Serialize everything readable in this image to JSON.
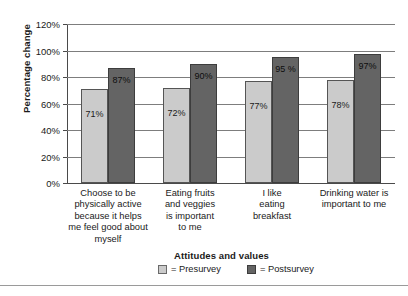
{
  "chart_data": {
    "type": "bar",
    "title": "",
    "xlabel": "Attitudes and values",
    "ylabel": "Percentage change",
    "ylim": [
      0,
      120
    ],
    "ytick_labels": [
      "0%",
      "20%",
      "40%",
      "60%",
      "80%",
      "100%",
      "120%"
    ],
    "ytick_values": [
      0,
      20,
      40,
      60,
      80,
      100,
      120
    ],
    "grid": true,
    "legend_position": "bottom",
    "categories": [
      "Choose to be\nphysically active\nbecause it helps\nme feel good about\nmyself",
      "Eating fruits\nand veggies\nis important\nto me",
      "I like\neating\nbreakfast",
      "Drinking water is\nimportant to me"
    ],
    "category_lines": [
      [
        "Choose to be",
        "physically active",
        "because it helps",
        "me feel good about",
        "myself"
      ],
      [
        "Eating fruits",
        "and veggies",
        "is important",
        "to me"
      ],
      [
        "I like",
        "eating",
        "breakfast"
      ],
      [
        "Drinking water is",
        "important to me"
      ]
    ],
    "series": [
      {
        "name": "Presurvey",
        "color": "#cbcbcb",
        "values": [
          71,
          72,
          77,
          78
        ],
        "labels": [
          "71%",
          "72%",
          "77%",
          "78%"
        ]
      },
      {
        "name": "Postsurvey",
        "color": "#646464",
        "values": [
          87,
          90,
          95,
          97
        ],
        "labels": [
          "87%",
          "90%",
          "95 %",
          "97%"
        ]
      }
    ]
  },
  "legend": {
    "items": [
      {
        "equals": "= Presurvey"
      },
      {
        "equals": "= Postsurvey"
      }
    ]
  }
}
